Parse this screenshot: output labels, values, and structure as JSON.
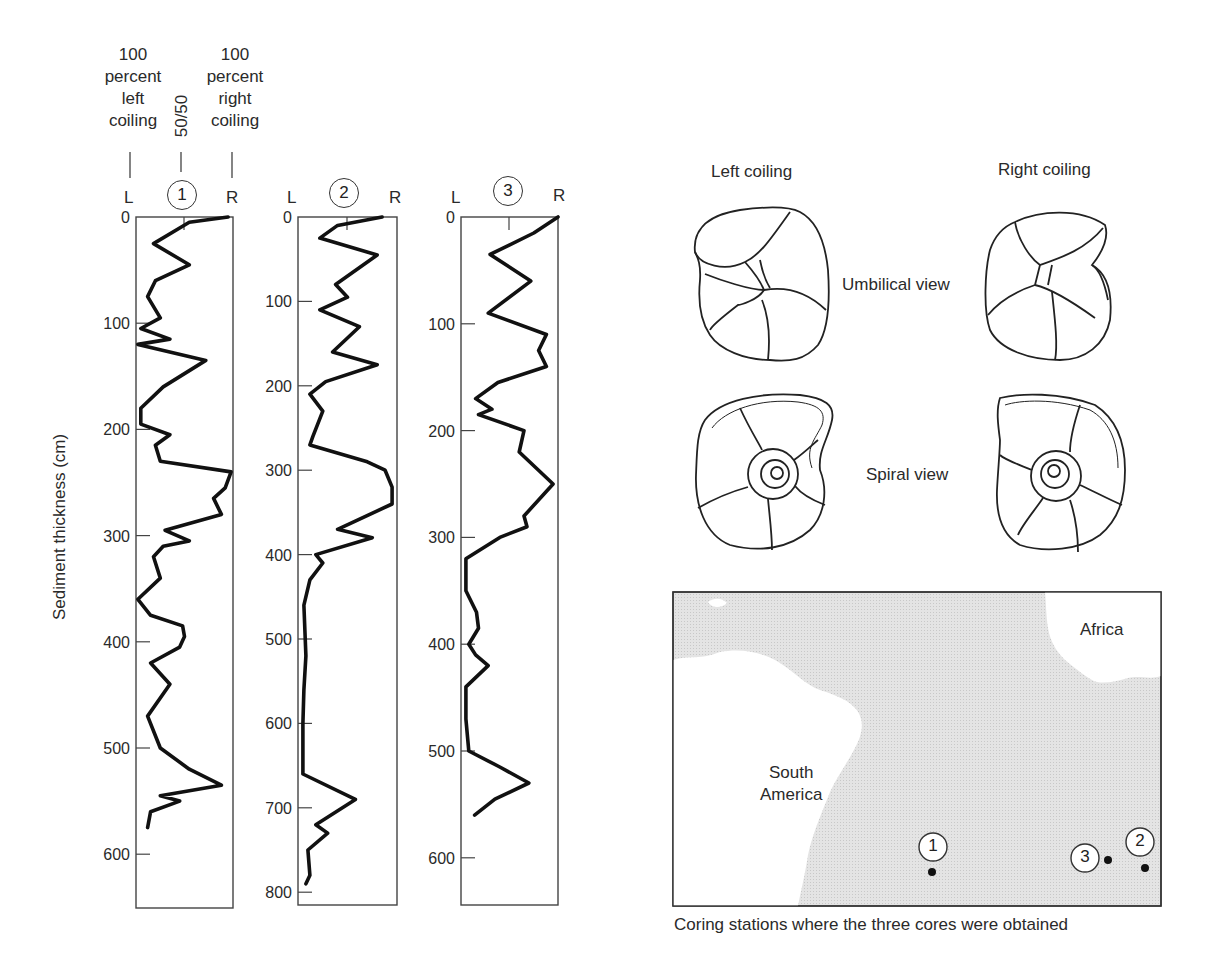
{
  "figure": {
    "y_axis_label": "Sediment thickness (cm)",
    "scale_header": {
      "left": [
        "100",
        "percent",
        "left",
        "coiling"
      ],
      "middle": "50/50",
      "right": [
        "100",
        "percent",
        "right",
        "coiling"
      ]
    },
    "cores": [
      {
        "id": "1",
        "left_label": "L",
        "right_label": "R",
        "ticks": [
          "0",
          "100",
          "200",
          "300",
          "400",
          "500",
          "600"
        ]
      },
      {
        "id": "2",
        "left_label": "L",
        "right_label": "R",
        "ticks": [
          "0",
          "100",
          "200",
          "300",
          "400",
          "500",
          "600",
          "700",
          "800"
        ]
      },
      {
        "id": "3",
        "left_label": "L",
        "right_label": "R",
        "ticks": [
          "0",
          "100",
          "200",
          "300",
          "400",
          "500",
          "600"
        ]
      }
    ],
    "morphology": {
      "left_title": "Left coiling",
      "right_title": "Right coiling",
      "umbilical_label": "Umbilical view",
      "spiral_label": "Spiral view"
    },
    "map": {
      "continents": [
        "South America",
        "Africa"
      ],
      "south_america_label": [
        "South",
        "America"
      ],
      "africa_label": "Africa",
      "stations": [
        {
          "id": "1"
        },
        {
          "id": "3"
        },
        {
          "id": "2"
        }
      ],
      "caption": "Coring stations where the three cores were obtained"
    }
  },
  "chart_data": [
    {
      "type": "line",
      "title": "Core 1",
      "xlabel": "Coiling direction (L = 100% left, center = 50/50, R = 100% right)",
      "ylabel": "Sediment thickness (cm)",
      "ylim": [
        0,
        650
      ],
      "xlim": [
        0,
        100
      ],
      "note": "x = percent right coiling (0 = L, 50 = 50/50, 100 = R), approximate",
      "depth": [
        0,
        5,
        25,
        45,
        60,
        75,
        95,
        105,
        115,
        120,
        135,
        160,
        180,
        195,
        205,
        215,
        230,
        240,
        255,
        265,
        280,
        295,
        305,
        310,
        320,
        340,
        360,
        375,
        385,
        395,
        405,
        420,
        440,
        470,
        500,
        520,
        535,
        545,
        550,
        560,
        575
      ],
      "values": [
        95,
        55,
        18,
        55,
        20,
        12,
        25,
        5,
        35,
        2,
        72,
        28,
        5,
        5,
        35,
        20,
        25,
        98,
        92,
        80,
        88,
        30,
        55,
        28,
        18,
        25,
        2,
        15,
        48,
        50,
        45,
        15,
        35,
        12,
        25,
        55,
        88,
        25,
        45,
        15,
        12
      ]
    },
    {
      "type": "line",
      "title": "Core 2",
      "xlabel": "Coiling direction (L = 100% left, center = 50/50, R = 100% right)",
      "ylabel": "Sediment thickness (cm)",
      "ylim": [
        0,
        810
      ],
      "xlim": [
        0,
        100
      ],
      "note": "x = percent right coiling (0 = L, 50 = 50/50, 100 = R), approximate",
      "depth": [
        0,
        10,
        25,
        45,
        80,
        95,
        110,
        130,
        160,
        175,
        195,
        210,
        230,
        260,
        270,
        290,
        300,
        320,
        340,
        370,
        380,
        400,
        410,
        430,
        460,
        520,
        560,
        600,
        660,
        690,
        720,
        730,
        750,
        780,
        790
      ],
      "values": [
        85,
        40,
        22,
        80,
        38,
        50,
        22,
        62,
        35,
        80,
        28,
        12,
        25,
        15,
        12,
        70,
        88,
        95,
        95,
        40,
        75,
        18,
        25,
        12,
        6,
        8,
        6,
        5,
        5,
        58,
        18,
        30,
        10,
        12,
        8
      ]
    },
    {
      "type": "line",
      "title": "Core 3",
      "xlabel": "Coiling direction (L = 100% left, center = 50/50, R = 100% right)",
      "ylabel": "Sediment thickness (cm)",
      "ylim": [
        0,
        650
      ],
      "xlim": [
        0,
        100
      ],
      "note": "x = percent right coiling (0 = L, 50 = 50/50, 100 = R), approximate",
      "depth": [
        0,
        15,
        35,
        60,
        90,
        110,
        125,
        140,
        155,
        170,
        180,
        185,
        200,
        220,
        250,
        280,
        290,
        300,
        320,
        350,
        370,
        385,
        400,
        410,
        420,
        440,
        470,
        500,
        515,
        530,
        545,
        560
      ],
      "values": [
        100,
        75,
        30,
        72,
        28,
        88,
        80,
        88,
        38,
        15,
        32,
        18,
        65,
        60,
        95,
        65,
        68,
        40,
        5,
        5,
        16,
        18,
        8,
        15,
        28,
        5,
        5,
        8,
        40,
        70,
        35,
        14
      ]
    }
  ]
}
